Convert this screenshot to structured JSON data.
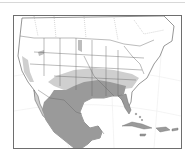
{
  "map": {
    "type": "range-map",
    "region": "North America",
    "colors": {
      "background": "#ffffff",
      "land": "#ffffff",
      "range_core": "#9a9a9a",
      "range_peripheral": "#cfcfcf",
      "borders": "#5a5a5a",
      "graticule": "#e6e6e6",
      "frame": "#6e6e6e"
    },
    "legend": []
  }
}
